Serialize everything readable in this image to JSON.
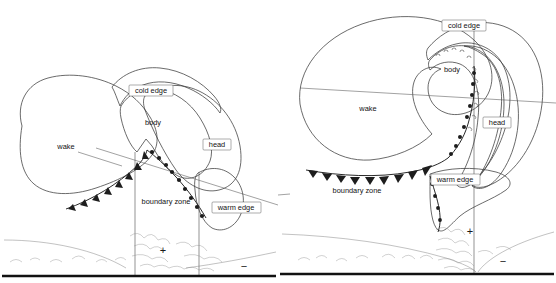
{
  "figure": {
    "panel_count": 2,
    "background_color": "#ffffff",
    "ink_color": "#1d1d1d"
  },
  "shared": {
    "region_labels": {
      "wake": "wake",
      "cold_edge": "cold edge",
      "body": "body",
      "head": "head",
      "warm_edge": "warm edge",
      "boundary_zone": "boundary zone"
    },
    "pressure_signs": {
      "positive": "+",
      "negative": "−"
    },
    "fill_styles": {
      "wake": "light-stipple",
      "cold_edge": "medium-stipple",
      "body": "white",
      "head": "dark-checker",
      "warm_edge": "fine-grid"
    },
    "fill_colors": {
      "wake": "#f2f2f2",
      "cold_edge": "#d8d8d8",
      "body": "#ffffff",
      "head": "#5a5a5a",
      "warm_edge": "#c9c9c9",
      "ground": "#111111"
    }
  },
  "panels": [
    {
      "id": "left",
      "name": "panel-left",
      "labels": [
        {
          "key": "cold_edge",
          "text": "cold edge",
          "boxed": true,
          "x": 154,
          "y": 91
        },
        {
          "key": "body",
          "text": "body",
          "boxed": false,
          "x": 153,
          "y": 123
        },
        {
          "key": "head",
          "text": "head",
          "boxed": true,
          "x": 218,
          "y": 145
        },
        {
          "key": "wake",
          "text": "wake",
          "boxed": false,
          "x": 66,
          "y": 147,
          "leader": true
        },
        {
          "key": "warm_edge",
          "text": "warm edge",
          "boxed": true,
          "x": 235,
          "y": 208
        },
        {
          "key": "boundary_zone",
          "text": "boundary zone",
          "boxed": false,
          "x": 163,
          "y": 202
        }
      ],
      "signs": [
        {
          "text": "+",
          "x": 163,
          "y": 251
        },
        {
          "text": "−",
          "x": 244,
          "y": 267
        }
      ],
      "ground_y": 276
    },
    {
      "id": "right",
      "name": "panel-right",
      "labels": [
        {
          "key": "cold_edge",
          "text": "cold edge",
          "boxed": true,
          "x": 464,
          "y": 26
        },
        {
          "key": "body",
          "text": "body",
          "boxed": false,
          "x": 452,
          "y": 70
        },
        {
          "key": "head",
          "text": "head",
          "boxed": true,
          "x": 497,
          "y": 123
        },
        {
          "key": "wake",
          "text": "wake",
          "boxed": false,
          "x": 368,
          "y": 109
        },
        {
          "key": "warm_edge",
          "text": "warm edge",
          "boxed": true,
          "x": 455,
          "y": 180
        },
        {
          "key": "boundary_zone",
          "text": "boundary zone",
          "boxed": false,
          "x": 357,
          "y": 191
        }
      ],
      "signs": [
        {
          "text": "+",
          "x": 470,
          "y": 232
        },
        {
          "text": "−",
          "x": 503,
          "y": 262
        }
      ],
      "ground_y": 274
    }
  ]
}
